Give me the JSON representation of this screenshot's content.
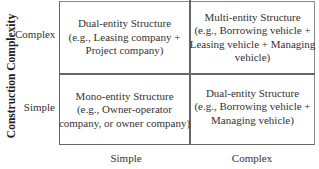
{
  "y_axis": {
    "title": "Construction Complexity",
    "ticks": [
      "Complex",
      "Simple"
    ]
  },
  "x_axis": {
    "ticks": [
      "Simple",
      "Complex"
    ]
  },
  "cells": {
    "top_left": {
      "line1": "Dual-entity Structure",
      "line2": "(e.g., Leasing company +",
      "line3": "Project company)"
    },
    "top_right": {
      "line1": "Multi-entity Structure",
      "line2": "(e.g., Borrowing vehicle +",
      "line3": "Leasing vehicle + Managing",
      "line4": "vehicle)"
    },
    "bottom_left": {
      "line1": "Mono-entity Structure",
      "line2": "(e.g., Owner-operator",
      "line3": "company, or owner company)"
    },
    "bottom_right": {
      "line1": "Dual-entity Structure",
      "line2": "(e.g., Borrowing vehicle +",
      "line3": "Managing vehicle)"
    }
  }
}
